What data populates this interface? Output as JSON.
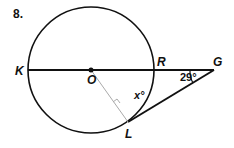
{
  "problem": {
    "number": "8."
  },
  "points": {
    "K": "K",
    "O": "O",
    "R": "R",
    "G": "G",
    "L": "L"
  },
  "angles": {
    "G": "29°",
    "x": "x°"
  },
  "colors": {
    "stroke": "#111111",
    "radius_line": "#aaaaaa"
  }
}
